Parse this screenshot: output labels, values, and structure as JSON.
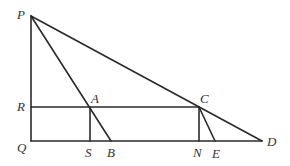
{
  "diagram": {
    "type": "geometry",
    "points": {
      "P": {
        "label": "P",
        "x": 31,
        "y": 16
      },
      "Q": {
        "label": "Q",
        "x": 31,
        "y": 141
      },
      "R": {
        "label": "R",
        "x": 31,
        "y": 107
      },
      "A": {
        "label": "A",
        "x": 90,
        "y": 107
      },
      "S": {
        "label": "S",
        "x": 90,
        "y": 141
      },
      "B": {
        "label": "B",
        "x": 111,
        "y": 141
      },
      "C": {
        "label": "C",
        "x": 199,
        "y": 107
      },
      "N": {
        "label": "N",
        "x": 199,
        "y": 141
      },
      "E": {
        "label": "E",
        "x": 215,
        "y": 141
      },
      "D": {
        "label": "D",
        "x": 262,
        "y": 141
      }
    },
    "segments": [
      [
        "P",
        "Q"
      ],
      [
        "Q",
        "D"
      ],
      [
        "P",
        "D"
      ],
      [
        "P",
        "B"
      ],
      [
        "R",
        "C"
      ],
      [
        "A",
        "S"
      ],
      [
        "C",
        "N"
      ],
      [
        "C",
        "E"
      ]
    ],
    "line_color": "#2a2a2a",
    "label_color": "#333333"
  }
}
